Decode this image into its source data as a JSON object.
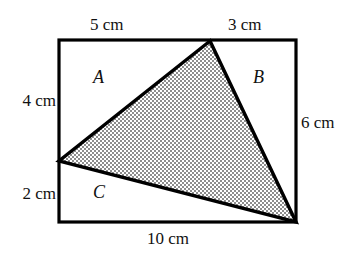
{
  "figure": {
    "type": "geometry-diagram",
    "canvas": {
      "width": 359,
      "height": 266
    },
    "colors": {
      "stroke": "#000000",
      "background": "#ffffff",
      "triangle_fill": "#b3b3b3",
      "text": "#111111"
    },
    "rectangle": {
      "corners": {
        "top_left": {
          "x": 59,
          "y": 40
        },
        "top_right": {
          "x": 296,
          "y": 40
        },
        "bottom_right": {
          "x": 296,
          "y": 222
        },
        "bottom_left": {
          "x": 59,
          "y": 222
        }
      },
      "width_cm": 10,
      "height_cm": 6
    },
    "triangle": {
      "shaded": true,
      "vertices": [
        {
          "name": "apex-on-top-edge",
          "x": 210,
          "y": 41
        },
        {
          "name": "vertex-on-left-edge",
          "x": 59,
          "y": 161
        },
        {
          "name": "vertex-at-corner",
          "x": 296,
          "y": 222
        }
      ]
    },
    "dimension_labels": {
      "top_left": "5 cm",
      "top_right": "3 cm",
      "left_upper": "4 cm",
      "left_lower": "2 cm",
      "right": "6 cm",
      "bottom": "10 cm"
    },
    "region_labels": {
      "a": "A",
      "b": "B",
      "c": "C"
    }
  }
}
